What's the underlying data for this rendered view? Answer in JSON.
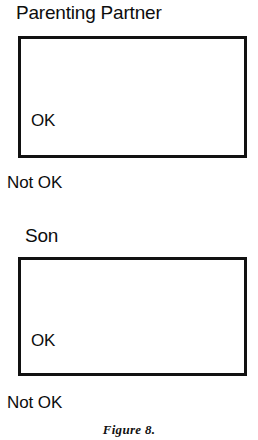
{
  "figure": {
    "caption": "Figure 8.",
    "panels": [
      {
        "title": "Parenting Partner",
        "upper_label": "OK",
        "lower_label": "Not OK"
      },
      {
        "title": "Son",
        "upper_label": "OK",
        "lower_label": "Not OK"
      }
    ]
  },
  "colors": {
    "ink": "#111111",
    "paper": "#ffffff"
  }
}
